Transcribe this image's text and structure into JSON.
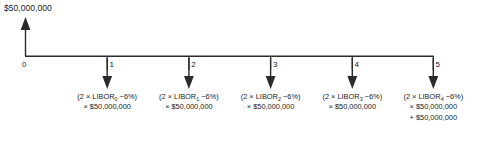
{
  "diagram": {
    "type": "cash-flow-timeline",
    "notional_label": "$50,000,000",
    "axis": {
      "start_x": 25,
      "end_x": 433,
      "y": 56,
      "tick_labels": [
        "0",
        "1",
        "2",
        "3",
        "4",
        "5"
      ]
    },
    "inflow_arrow": {
      "at_tick": "0",
      "direction": "up",
      "amount": "$50,000,000"
    },
    "outflows": [
      {
        "at_tick": "1",
        "direction": "down",
        "lines": [
          "(2 × LIBOR<sub>0</sub> −6%)",
          "× $50,000,000"
        ],
        "rate_term": "2 × LIBOR0 − 6%",
        "notional": "$50,000,000",
        "subscript": "0"
      },
      {
        "at_tick": "2",
        "direction": "down",
        "lines": [
          "(2 × LIBOR<sub>1</sub> −6%)",
          "× $50,000,000"
        ],
        "rate_term": "2 × LIBOR1 − 6%",
        "notional": "$50,000,000",
        "subscript": "1"
      },
      {
        "at_tick": "3",
        "direction": "down",
        "lines": [
          "(2 × LIBOR<sub>2</sub> −6%)",
          "× $50,000,000"
        ],
        "rate_term": "2 × LIBOR2 − 6%",
        "notional": "$50,000,000",
        "subscript": "2"
      },
      {
        "at_tick": "4",
        "direction": "down",
        "lines": [
          "(2 × LIBOR<sub>3</sub> −6%)",
          "× $50,000,000"
        ],
        "rate_term": "2 × LIBOR3 − 6%",
        "notional": "$50,000,000",
        "subscript": "3"
      },
      {
        "at_tick": "5",
        "direction": "down",
        "lines": [
          "(2 × LIBOR<sub>4</sub> −6%)",
          "× $50,000,000",
          "+ $50,000,000"
        ],
        "rate_term": "2 × LIBOR4 − 6%",
        "notional": "$50,000,000",
        "principal_repayment": "+ $50,000,000",
        "subscript": "4"
      }
    ],
    "colors": {
      "background": "#ffffff",
      "ink": "#1a1a1a",
      "axis": "#2b2b2b"
    }
  }
}
